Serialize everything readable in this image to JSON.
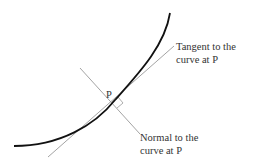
{
  "diagram": {
    "point_label": "P",
    "tangent_label_line1": "Tangent to the",
    "tangent_label_line2": "curve at P",
    "normal_label_line1": "Normal to the",
    "normal_label_line2": "curve at P",
    "colors": {
      "curve": "#111111",
      "lines": "#999999",
      "text": "#333333",
      "background": "#ffffff"
    }
  }
}
